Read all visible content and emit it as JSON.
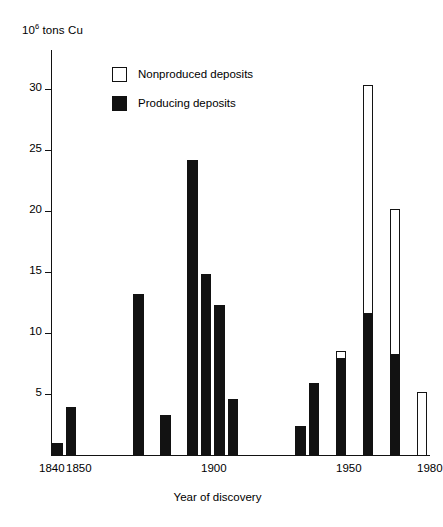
{
  "figure": {
    "unit_label_base": "10",
    "unit_label_exp": "6",
    "unit_label_rest": " tons Cu"
  },
  "legend": {
    "position": "inside-top-left",
    "items": [
      {
        "label": "Nonproduced deposits",
        "swatch": "open-square",
        "color": "#ffffff"
      },
      {
        "label": "Producing deposits",
        "swatch": "filled-square",
        "color": "#121212"
      }
    ]
  },
  "chart_data": {
    "type": "bar",
    "subtype": "stacked-histogram",
    "title": "",
    "subtitle": "",
    "xlabel": "Year of discovery",
    "ylabel": "10^6 tons Cu",
    "xlim": [
      1840,
      1980
    ],
    "ylim": [
      0,
      31
    ],
    "bin_width": 5,
    "grid": false,
    "xticks": [
      1840,
      1850,
      1900,
      1950,
      1980
    ],
    "xticklabels": [
      "1840",
      "1850",
      "1900",
      "1950",
      "1980"
    ],
    "yticks": [
      5,
      10,
      15,
      20,
      25,
      30
    ],
    "yticklabels": [
      "5",
      "10",
      "15",
      "20",
      "25",
      "30"
    ],
    "categories": [
      "1840",
      "1845",
      "1850",
      "1855",
      "1860",
      "1865",
      "1870",
      "1875",
      "1880",
      "1885",
      "1890",
      "1895",
      "1900",
      "1905",
      "1910",
      "1915",
      "1920",
      "1925",
      "1930",
      "1935",
      "1940",
      "1945",
      "1950",
      "1955",
      "1960",
      "1965",
      "1970",
      "1975"
    ],
    "series": [
      {
        "name": "Producing deposits",
        "color": "#121212",
        "values": [
          1.0,
          3.9,
          0,
          0,
          0,
          0,
          13.2,
          0,
          3.3,
          0,
          24.2,
          14.8,
          12.3,
          4.6,
          0,
          0,
          0,
          0,
          2.4,
          5.9,
          0,
          8.0,
          0,
          11.7,
          0,
          8.3,
          0,
          0
        ]
      },
      {
        "name": "Nonproduced deposits",
        "color": "#ffffff",
        "values": [
          0,
          0,
          0,
          0,
          0,
          0,
          0,
          0,
          0,
          0,
          0,
          0,
          0,
          0,
          0,
          0,
          0,
          0,
          0,
          0,
          0,
          0.5,
          0,
          18.6,
          0,
          11.9,
          0,
          5.2
        ]
      }
    ],
    "totals": [
      1.0,
      3.9,
      0,
      0,
      0,
      0,
      13.2,
      0,
      3.3,
      0,
      24.2,
      14.8,
      12.3,
      4.6,
      0,
      0,
      0,
      0,
      2.4,
      5.9,
      0,
      8.5,
      0,
      30.3,
      0,
      20.2,
      0,
      5.2
    ]
  }
}
